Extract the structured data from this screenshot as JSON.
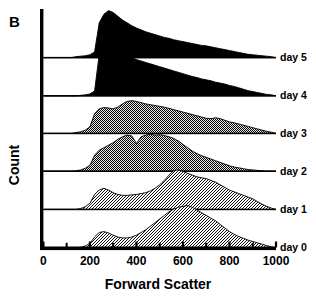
{
  "panel": {
    "label": "B"
  },
  "axes": {
    "x": {
      "title": "Forward Scatter",
      "ticks": [
        0,
        200,
        400,
        600,
        800,
        1000
      ],
      "tick_labels": [
        "0",
        "200",
        "400",
        "600",
        "800",
        "1000"
      ],
      "minor_ticks": [
        100,
        300,
        500,
        700,
        900
      ],
      "range": [
        0,
        1000
      ]
    },
    "y": {
      "title": "Count"
    }
  },
  "colors": {
    "axis": "#000000",
    "fill_day5": "#000000",
    "fill_day4": "#000000",
    "fill_day3": "#2b2b2b",
    "fill_day2": "#3a3a3a",
    "fill_day1": "#9a9a9a",
    "fill_day0": "#9f9f9f",
    "outline": "#000000",
    "background": "#ffffff"
  },
  "chart_data": {
    "type": "area",
    "title": "",
    "subtitle": "",
    "xlabel": "Forward Scatter",
    "ylabel": "Count",
    "xlim": [
      0,
      1000
    ],
    "grid": false,
    "legend_position": "right-inline",
    "layout": "ridgeline",
    "x": [
      0,
      20,
      40,
      60,
      80,
      100,
      120,
      140,
      160,
      180,
      200,
      220,
      240,
      260,
      280,
      300,
      320,
      340,
      360,
      380,
      400,
      420,
      440,
      460,
      480,
      500,
      520,
      540,
      560,
      580,
      600,
      620,
      640,
      660,
      680,
      700,
      720,
      740,
      760,
      780,
      800,
      820,
      840,
      860,
      880,
      900,
      920,
      940,
      960,
      980,
      1000
    ],
    "series": [
      {
        "name": "day 5",
        "label": "day 5",
        "fill": "#000000",
        "pattern": "solid",
        "values": [
          0,
          0,
          0,
          0,
          0,
          0,
          0,
          2,
          3,
          4,
          6,
          12,
          74,
          92,
          100,
          96,
          88,
          80,
          74,
          68,
          63,
          59,
          55,
          52,
          49,
          46,
          43,
          41,
          38,
          36,
          34,
          32,
          30,
          28,
          26,
          25,
          23,
          21,
          19,
          17,
          15,
          13,
          11,
          9,
          7,
          6,
          5,
          4,
          3,
          2,
          0
        ]
      },
      {
        "name": "day 4",
        "label": "day 4",
        "fill": "#000000",
        "pattern": "solid",
        "values": [
          0,
          0,
          0,
          0,
          0,
          0,
          0,
          0,
          1,
          2,
          4,
          10,
          88,
          96,
          100,
          97,
          93,
          89,
          85,
          81,
          77,
          74,
          71,
          68,
          65,
          62,
          59,
          56,
          53,
          50,
          47,
          44,
          41,
          39,
          36,
          34,
          32,
          29,
          27,
          25,
          22,
          20,
          17,
          14,
          11,
          9,
          7,
          5,
          3,
          2,
          0
        ]
      },
      {
        "name": "day 3",
        "label": "day 3",
        "fill": "#2b2b2b",
        "pattern": "dither-dark",
        "values": [
          0,
          0,
          0,
          0,
          0,
          0,
          0,
          2,
          4,
          8,
          16,
          48,
          60,
          63,
          62,
          60,
          64,
          72,
          78,
          80,
          78,
          75,
          72,
          70,
          68,
          66,
          64,
          61,
          58,
          55,
          52,
          49,
          46,
          43,
          40,
          37,
          36,
          38,
          36,
          32,
          28,
          26,
          23,
          20,
          17,
          14,
          11,
          8,
          5,
          3,
          0
        ]
      },
      {
        "name": "day 2",
        "label": "day 2",
        "fill": "#3a3a3a",
        "pattern": "dither-dark",
        "values": [
          0,
          0,
          0,
          0,
          0,
          0,
          0,
          1,
          3,
          7,
          14,
          38,
          50,
          56,
          62,
          68,
          76,
          82,
          86,
          84,
          66,
          82,
          86,
          88,
          86,
          87,
          85,
          82,
          78,
          72,
          64,
          56,
          48,
          42,
          37,
          33,
          29,
          25,
          21,
          17,
          13,
          10,
          8,
          6,
          4,
          3,
          2,
          1,
          0,
          0,
          0
        ]
      },
      {
        "name": "day 1",
        "label": "day 1",
        "fill": "#9a9a9a",
        "pattern": "dither-light",
        "values": [
          0,
          0,
          0,
          0,
          0,
          0,
          0,
          0,
          2,
          6,
          14,
          34,
          44,
          48,
          44,
          38,
          34,
          32,
          32,
          33,
          34,
          36,
          38,
          42,
          48,
          56,
          66,
          78,
          88,
          90,
          86,
          82,
          78,
          74,
          72,
          70,
          66,
          62,
          56,
          50,
          44,
          40,
          36,
          32,
          28,
          24,
          18,
          12,
          7,
          3,
          0
        ]
      },
      {
        "name": "day 0",
        "label": "day 0",
        "fill": "#9f9f9f",
        "pattern": "dither-light",
        "values": [
          0,
          0,
          0,
          0,
          0,
          0,
          0,
          0,
          1,
          4,
          10,
          24,
          34,
          36,
          33,
          28,
          24,
          22,
          22,
          24,
          28,
          34,
          40,
          48,
          56,
          64,
          72,
          80,
          86,
          90,
          92,
          94,
          90,
          84,
          78,
          72,
          66,
          60,
          52,
          44,
          36,
          30,
          25,
          21,
          17,
          14,
          11,
          8,
          5,
          2,
          0
        ]
      }
    ]
  }
}
